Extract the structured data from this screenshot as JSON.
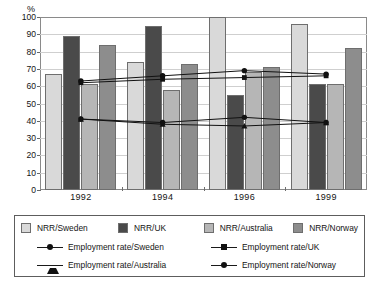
{
  "chart_data": {
    "type": "bar",
    "title": "",
    "xlabel": "",
    "ylabel": "%",
    "ylim": [
      0,
      100
    ],
    "ytick_step": 10,
    "ytick_labels": [
      "100",
      "90",
      "80",
      "70",
      "60",
      "50",
      "40",
      "30",
      "20",
      "10",
      "0"
    ],
    "grid": true,
    "categories": [
      "1992",
      "1994",
      "1996",
      "1999"
    ],
    "legend_position": "bottom",
    "bar_series": [
      {
        "name": "NRR/Sweden",
        "color": "#d9d9d9",
        "values": [
          67,
          74,
          100,
          96
        ]
      },
      {
        "name": "NRR/UK",
        "color": "#4a4a4a",
        "values": [
          89,
          95,
          55,
          61
        ]
      },
      {
        "name": "NRR/Australia",
        "color": "#b6b6b6",
        "values": [
          61,
          58,
          68,
          61
        ]
      },
      {
        "name": "NRR/Norway",
        "color": "#8d8d8d",
        "values": [
          84,
          73,
          71,
          82
        ]
      }
    ],
    "line_series": [
      {
        "name": "Employment rate/Sweden",
        "marker": "dot",
        "color": "#111111",
        "values": [
          63,
          66,
          69,
          67
        ]
      },
      {
        "name": "Employment rate/UK",
        "marker": "square",
        "color": "#111111",
        "values": [
          62,
          64,
          65,
          66
        ]
      },
      {
        "name": "Employment rate/Australia",
        "marker": "tri",
        "color": "#111111",
        "values": [
          41,
          38,
          37,
          39
        ]
      },
      {
        "name": "Employment rate/Norway",
        "marker": "dot",
        "color": "#111111",
        "values": [
          41,
          39,
          42,
          39
        ]
      }
    ]
  },
  "axis": {
    "unit_label": "%"
  },
  "legend": {
    "bars": [
      {
        "label": "NRR/Sweden"
      },
      {
        "label": "NRR/UK"
      },
      {
        "label": "NRR/Australia"
      },
      {
        "label": "NRR/Norway"
      }
    ],
    "lines": [
      {
        "label": "Employment rate/Sweden"
      },
      {
        "label": "Employment rate/UK"
      },
      {
        "label": "Employment rate/Australia"
      },
      {
        "label": "Employment rate/Norway"
      }
    ]
  }
}
